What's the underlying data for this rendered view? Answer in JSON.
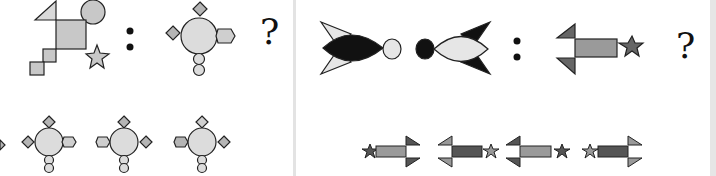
{
  "puzzles": [
    {
      "id": "left",
      "question_mark": "?",
      "separator": ":",
      "pair": [
        "square-with-triangle-circle-star-steps",
        "circle-with-diamonds-hexagon-and-two-circles"
      ],
      "options_count": 4,
      "colors": {
        "light_fill": "#d9d9d9",
        "mid_fill": "#b8b8b8",
        "stroke": "#222222"
      }
    },
    {
      "id": "right",
      "question_mark": "?",
      "separator": ":",
      "pair": [
        "black-fish-with-light-circle",
        "light-fish-with-black-circle"
      ],
      "options_count": 4,
      "colors": {
        "dark_fill": "#111111",
        "light_fill": "#e6e6e6",
        "gray_fill": "#8c8c8c",
        "dark_gray_fill": "#555555",
        "stroke": "#222222"
      }
    }
  ]
}
